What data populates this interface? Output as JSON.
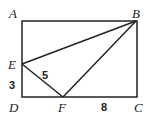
{
  "diagram": {
    "type": "geometry",
    "shape": "rectangle ABCD with points E on AD and F on DC",
    "points": {
      "A": {
        "label": "A"
      },
      "B": {
        "label": "B"
      },
      "C": {
        "label": "C"
      },
      "D": {
        "label": "D"
      },
      "E": {
        "label": "E"
      },
      "F": {
        "label": "F"
      }
    },
    "segments": [
      "AB",
      "BC",
      "CD",
      "DA",
      "EB",
      "EF",
      "FB"
    ],
    "lengths": {
      "EF": "5",
      "ED": "3",
      "FC": "8"
    }
  }
}
